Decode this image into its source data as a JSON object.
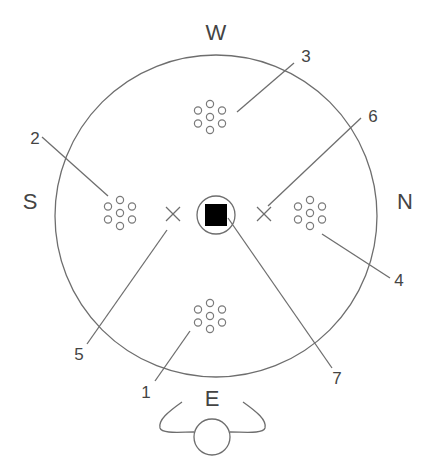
{
  "diagram": {
    "directions": {
      "west": "W",
      "south": "S",
      "north": "N",
      "east": "E"
    },
    "callouts": [
      {
        "number": "1",
        "target": "dot-cluster-east"
      },
      {
        "number": "2",
        "target": "dot-cluster-south"
      },
      {
        "number": "3",
        "target": "dot-cluster-west"
      },
      {
        "number": "4",
        "target": "dot-cluster-north"
      },
      {
        "number": "5",
        "target": "cross-marker-south"
      },
      {
        "number": "6",
        "target": "cross-marker-north"
      },
      {
        "number": "7",
        "target": "center-square"
      }
    ],
    "colors": {
      "line": "#6e6e6e",
      "center_square": "#000000",
      "background": "#ffffff"
    }
  }
}
